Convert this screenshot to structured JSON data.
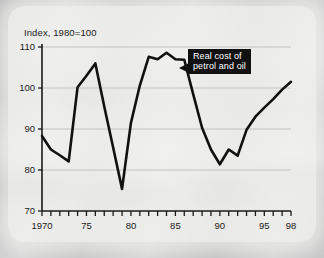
{
  "figure": {
    "axis_title": "Index, 1980=100",
    "background_description": "traffic-jam-photo"
  },
  "callout": {
    "line1": "Real cost of",
    "line2": "petrol and oil",
    "background_color": "#111111",
    "text_color": "#ffffff"
  },
  "chart_data": {
    "type": "line",
    "title": "Index, 1980=100",
    "xlabel": "",
    "ylabel": "Index, 1980=100",
    "xlim": [
      1970,
      1998
    ],
    "ylim": [
      70,
      110
    ],
    "grid": "horizontal",
    "legend": "annotation-callout",
    "annotations": [
      {
        "text": "Real cost of petrol and oil",
        "points_to_year": 1985
      }
    ],
    "y_ticks": [
      70,
      80,
      90,
      100,
      110
    ],
    "y_tick_labels": [
      "70",
      "80",
      "90",
      "100",
      "110"
    ],
    "x_ticks": [
      1970,
      1971,
      1972,
      1973,
      1974,
      1975,
      1976,
      1977,
      1978,
      1979,
      1980,
      1981,
      1982,
      1983,
      1984,
      1985,
      1986,
      1987,
      1988,
      1989,
      1990,
      1991,
      1992,
      1993,
      1994,
      1995,
      1996,
      1997,
      1998
    ],
    "x_tick_labels": [
      {
        "value": 1970,
        "label": "1970"
      },
      {
        "value": 1975,
        "label": "75"
      },
      {
        "value": 1980,
        "label": "80"
      },
      {
        "value": 1985,
        "label": "85"
      },
      {
        "value": 1990,
        "label": "90"
      },
      {
        "value": 1995,
        "label": "95"
      },
      {
        "value": 1998,
        "label": "98"
      }
    ],
    "series": [
      {
        "name": "Real cost of petrol and oil",
        "color": "#111111",
        "x": [
          1970,
          1971,
          1972,
          1973,
          1974,
          1975,
          1976,
          1977,
          1978,
          1979,
          1980,
          1981,
          1982,
          1983,
          1984,
          1985,
          1986,
          1987,
          1988,
          1989,
          1990,
          1991,
          1992,
          1993,
          1994,
          1995,
          1996,
          1997,
          1998
        ],
        "values": [
          88.3,
          85.0,
          83.6,
          82.1,
          100.2,
          103.0,
          106.0,
          95.5,
          85.5,
          75.4,
          91.5,
          100.6,
          107.6,
          107.0,
          108.6,
          107.0,
          106.9,
          98.5,
          90.3,
          85.0,
          81.4,
          85.0,
          83.5,
          89.8,
          93.0,
          95.2,
          97.3,
          99.6,
          101.5
        ]
      }
    ]
  }
}
